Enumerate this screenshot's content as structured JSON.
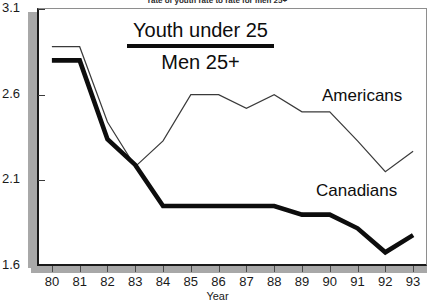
{
  "caption": "rate of youth rate to rate for men 25+",
  "legend": {
    "numerator": "Youth under 25",
    "denominator": "Men 25+"
  },
  "axis": {
    "x_title": "Year",
    "y_ticks": [
      "3.1",
      "2.6",
      "2.1",
      "1.6"
    ],
    "x_ticks": [
      "80",
      "81",
      "82",
      "83",
      "84",
      "85",
      "86",
      "87",
      "88",
      "89",
      "90",
      "91",
      "92",
      "93"
    ]
  },
  "annotations": {
    "americans": "Americans",
    "canadians": "Canadians"
  },
  "chart_data": {
    "type": "line",
    "title": "rate of youth rate to rate for men 25+",
    "xlabel": "Year",
    "ylabel": "",
    "x": [
      80,
      81,
      82,
      83,
      84,
      85,
      86,
      87,
      88,
      89,
      90,
      91,
      92,
      93
    ],
    "xlim": [
      79.5,
      93.5
    ],
    "ylim": [
      1.6,
      3.1
    ],
    "ytick_values": [
      3.1,
      2.6,
      2.1,
      1.6
    ],
    "grid": false,
    "legend_position": "inline-annotations",
    "series": [
      {
        "name": "Americans",
        "style": "thin",
        "color": "#3a3a3a",
        "values": [
          2.88,
          2.88,
          2.44,
          2.18,
          2.33,
          2.6,
          2.6,
          2.52,
          2.6,
          2.5,
          2.5,
          2.33,
          2.15,
          2.27
        ]
      },
      {
        "name": "Canadians",
        "style": "thick",
        "color": "#0d0d0d",
        "values": [
          2.8,
          2.8,
          2.34,
          2.19,
          1.95,
          1.95,
          1.95,
          1.95,
          1.95,
          1.9,
          1.9,
          1.82,
          1.68,
          1.78
        ]
      }
    ]
  }
}
